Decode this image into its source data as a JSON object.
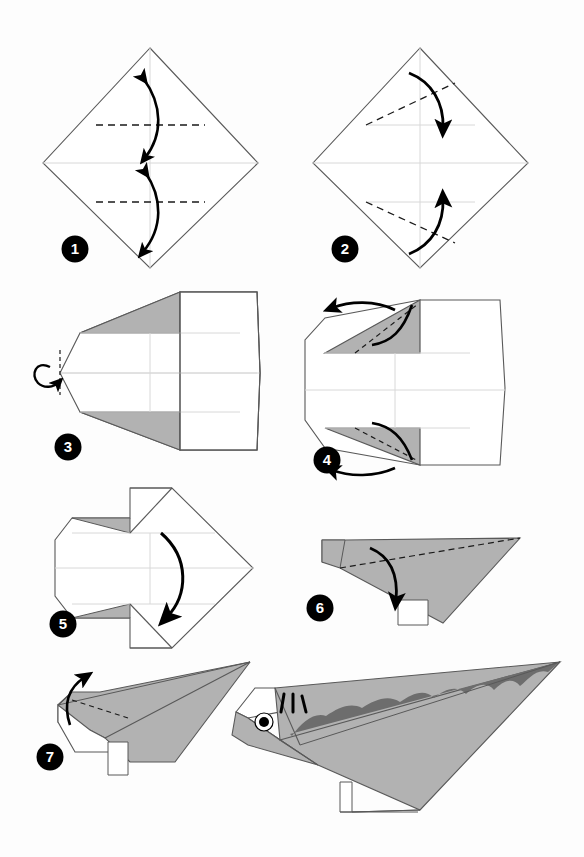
{
  "document": {
    "type": "origami-folding-instructions",
    "subject": "Dinosaur (Stegosaurus)",
    "total_steps": 7,
    "page_background": "#fdfdfd"
  },
  "palette": {
    "paper_white": "#ffffff",
    "paper_gray": "#b2b2b2",
    "paper_dark_gray": "#6d6d6d",
    "outline": "#595959",
    "crease_line": "#d8d8d8",
    "dashed_fold": "#1a1a1a",
    "arrow": "#000000",
    "badge_fill": "#000000",
    "badge_text": "#ffffff"
  },
  "steps": [
    {
      "number": "1",
      "badge_x": 75,
      "badge_y": 249,
      "caption": "Fold top and bottom corners to the center line and unfold",
      "shape": "square-on-point",
      "fold_type": "valley-unfold",
      "arrow_count": 2,
      "arrow_style": "double-headed",
      "dashed_lines": 2,
      "dashed_orientation": "horizontal"
    },
    {
      "number": "2",
      "badge_x": 345,
      "badge_y": 249,
      "caption": "Fold the upper-left and lower-left edges in along the diagonals",
      "shape": "square-on-point",
      "fold_type": "valley",
      "arrow_count": 2,
      "arrow_style": "single-headed",
      "dashed_lines": 2,
      "dashed_orientation": "diagonal"
    },
    {
      "number": "3",
      "badge_x": 68,
      "badge_y": 447,
      "caption": "Reverse fold the left point",
      "shape": "kite-with-gray-flaps",
      "fold_type": "reverse-fold",
      "arrow_count": 1,
      "arrow_style": "loop",
      "dashed_lines": 1,
      "dashed_orientation": "vertical"
    },
    {
      "number": "4",
      "badge_x": 327,
      "badge_y": 460,
      "caption": "Fold the two gray flaps outward to the left",
      "shape": "kite-with-gray-flaps",
      "fold_type": "valley",
      "arrow_count": 2,
      "arrow_style": "single-headed",
      "dashed_lines": 2,
      "dashed_orientation": "diagonal"
    },
    {
      "number": "5",
      "badge_x": 63,
      "badge_y": 624,
      "caption": "Fold the model in half downward",
      "shape": "arrow-head",
      "fold_type": "mountain",
      "arrow_count": 1,
      "arrow_style": "single-headed-large",
      "dashed_lines": 0,
      "dashed_orientation": "none"
    },
    {
      "number": "6",
      "badge_x": 320,
      "badge_y": 608,
      "caption": "Fold the long top edge down along the diagonal",
      "shape": "side-view-wedge",
      "fold_type": "valley",
      "arrow_count": 1,
      "arrow_style": "single-headed",
      "dashed_lines": 1,
      "dashed_orientation": "long-diagonal"
    },
    {
      "number": "7",
      "badge_x": 50,
      "badge_y": 757,
      "caption": "Outside reverse fold to form the head",
      "shape": "dinosaur-body",
      "fold_type": "reverse-fold",
      "arrow_count": 1,
      "arrow_style": "single-headed",
      "dashed_lines": 1,
      "dashed_orientation": "short-diagonal"
    }
  ],
  "final_model": {
    "name": "Finished dinosaur",
    "has_eye": true,
    "eye_pupil_color": "#000000",
    "eye_white_color": "#ffffff",
    "face_marks": 3,
    "back_spikes": 5,
    "spike_color": "#6d6d6d",
    "body_color": "#b2b2b2"
  }
}
